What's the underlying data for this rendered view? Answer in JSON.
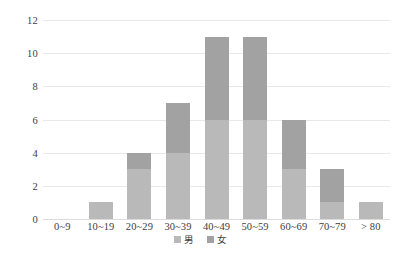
{
  "chart_data": {
    "type": "bar",
    "title": "",
    "subtitle": "",
    "xlabel": "",
    "ylabel": "",
    "stacked": true,
    "grid": true,
    "legend_position": "bottom-center",
    "ylim": [
      0,
      12
    ],
    "yticks": [
      0,
      2,
      4,
      6,
      8,
      10,
      12
    ],
    "categories": [
      "0~9",
      "10~19",
      "20~29",
      "30~39",
      "40~49",
      "50~59",
      "60~69",
      "70~79",
      "> 80"
    ],
    "series": [
      {
        "name": "男",
        "color": "#b9b9b9",
        "values": [
          0,
          1,
          3,
          4,
          6,
          6,
          3,
          1,
          1
        ]
      },
      {
        "name": "女",
        "color": "#a2a2a2",
        "values": [
          0,
          0,
          1,
          3,
          5,
          5,
          3,
          2,
          0
        ]
      }
    ],
    "totals": [
      0,
      1,
      4,
      7,
      11,
      11,
      6,
      3,
      1
    ]
  },
  "axis": {
    "y_tick_labels": [
      "0",
      "2",
      "4",
      "6",
      "8",
      "10",
      "12"
    ],
    "x_tick_labels": [
      "0~9",
      "10~19",
      "20~29",
      "30~39",
      "40~49",
      "50~59",
      "60~69",
      "70~79",
      "> 80"
    ]
  },
  "legend": {
    "items": [
      {
        "label": "男"
      },
      {
        "label": "女"
      }
    ]
  },
  "caption": {
    "text": ""
  }
}
